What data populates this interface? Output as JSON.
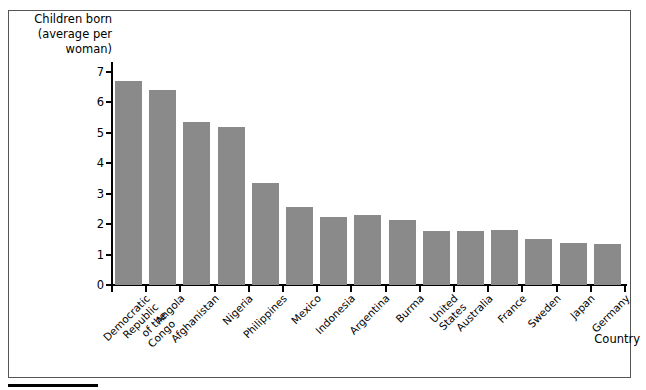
{
  "chart_data": {
    "type": "bar",
    "title": "",
    "ylabel": "Children born\n(average per\nwoman)",
    "xlabel": "Country",
    "ylim": [
      0,
      7
    ],
    "yticks": [
      0,
      1,
      2,
      3,
      4,
      5,
      6,
      7
    ],
    "grid": false,
    "legend": null,
    "bar_color": "#8a8a8a",
    "categories": [
      "Democratic Republic\nof the Congo",
      "Angola",
      "Afghanistan",
      "Nigeria",
      "Philippines",
      "Mexico",
      "Indonesia",
      "Argentina",
      "Burma",
      "United States",
      "Australia",
      "France",
      "Sweden",
      "Japan",
      "Germany"
    ],
    "values": [
      6.7,
      6.4,
      5.35,
      5.2,
      3.35,
      2.55,
      2.25,
      2.3,
      2.15,
      1.78,
      1.78,
      1.8,
      1.5,
      1.38,
      1.35
    ]
  }
}
